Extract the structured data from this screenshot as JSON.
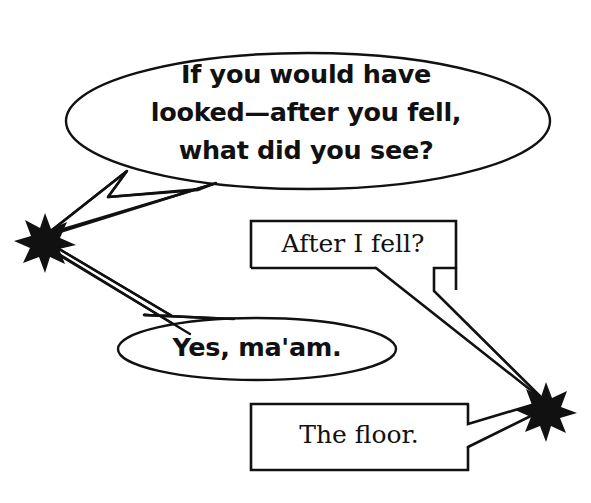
{
  "figure": {
    "kind": "speech-balloon-dialogue",
    "background_color": "#ffffff",
    "ink_color": "#111111",
    "width": 591,
    "height": 503
  },
  "speakers": [
    {
      "id": "speaker-left",
      "marker": "star-burst-icon",
      "fill": "#111111",
      "x": 45,
      "y": 237,
      "radius": 22,
      "points": 8
    },
    {
      "id": "speaker-right",
      "marker": "star-burst-icon",
      "fill": "#111111",
      "x": 546,
      "y": 405,
      "radius": 21,
      "points": 8
    }
  ],
  "balloons": [
    {
      "id": "question",
      "speaker": "speaker-left",
      "shape": "ellipse",
      "voice": "sans",
      "text": "If you would have\nlooked—after you fell,\nwhat did you see?",
      "lines": [
        "If you would have",
        "looked—after you fell,",
        "what did you see?"
      ]
    },
    {
      "id": "after",
      "speaker": "speaker-right",
      "shape": "rectangle",
      "voice": "serif",
      "text": "After I fell?",
      "lines": [
        "After I fell?"
      ]
    },
    {
      "id": "yes",
      "speaker": "speaker-left",
      "shape": "ellipse",
      "voice": "sans",
      "text": "Yes, ma'am.",
      "lines": [
        "Yes, ma'am."
      ]
    },
    {
      "id": "floor",
      "speaker": "speaker-right",
      "shape": "rectangle",
      "voice": "serif",
      "text": "The floor.",
      "lines": [
        "The floor."
      ]
    }
  ]
}
